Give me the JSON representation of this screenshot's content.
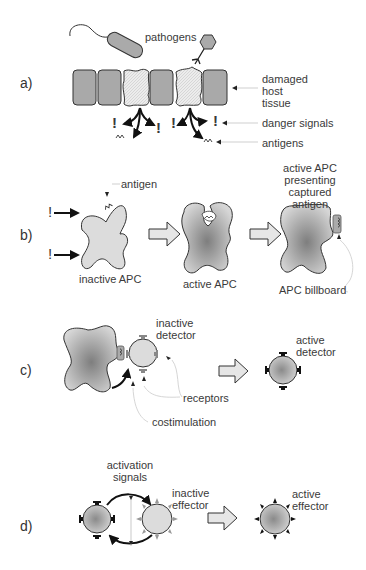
{
  "panels": {
    "a": {
      "marker": "a)",
      "labels": {
        "pathogens": "pathogens",
        "damaged_host_tissue_1": "damaged",
        "damaged_host_tissue_2": "host",
        "damaged_host_tissue_3": "tissue",
        "danger_signals": "danger signals",
        "antigens": "antigens"
      },
      "symbols": {
        "danger": "!"
      }
    },
    "b": {
      "marker": "b)",
      "labels": {
        "antigen": "antigen",
        "inactive_apc": "inactive APC",
        "active_apc": "active APC",
        "presenting_1": "active APC",
        "presenting_2": "presenting",
        "presenting_3": "captured",
        "presenting_4": "antigen",
        "apc_billboard": "APC billboard"
      },
      "symbols": {
        "danger": "!"
      }
    },
    "c": {
      "marker": "c)",
      "labels": {
        "inactive_detector_1": "inactive",
        "inactive_detector_2": "detector",
        "active_detector_1": "active",
        "active_detector_2": "detector",
        "receptors": "receptors",
        "costimulation": "costimulation"
      }
    },
    "d": {
      "marker": "d)",
      "labels": {
        "activation_signals_1": "activation",
        "activation_signals_2": "signals",
        "inactive_effector_1": "inactive",
        "inactive_effector_2": "effector",
        "active_effector_1": "active",
        "active_effector_2": "effector"
      }
    }
  },
  "colors": {
    "cell_fill": "#a9a9a9",
    "damaged_fill": "#e4e4e4",
    "inactive_fill": "#dcdcdc",
    "active_dark": "#8a8a8a",
    "outline": "#333333",
    "arrow_fill": "#e6e6e6",
    "leader_line": "#cfcfcf",
    "receptor_gray": "#888888"
  }
}
